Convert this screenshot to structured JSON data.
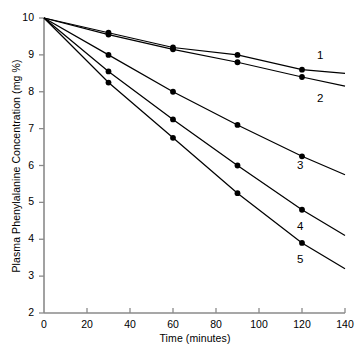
{
  "chart_data": {
    "type": "line",
    "title": "",
    "xlabel": "Time (minutes)",
    "ylabel": "Plasma Phenylalanine Concentration (mg %)",
    "xlim": [
      0,
      140
    ],
    "ylim": [
      2,
      10
    ],
    "xticks": [
      0,
      20,
      40,
      60,
      80,
      100,
      120,
      140
    ],
    "yticks": [
      2,
      3,
      4,
      5,
      6,
      7,
      8,
      9,
      10
    ],
    "xtick_labels": [
      "0",
      "20",
      "40",
      "60",
      "80",
      "100",
      "120",
      "140"
    ],
    "ytick_labels": [
      "2",
      "3",
      "4",
      "5",
      "6",
      "7",
      "8",
      "9",
      "10"
    ],
    "grid": false,
    "legend_position": "inline-right-end-of-line",
    "marker": "filled-circle",
    "line_color": "#000000",
    "marker_color": "#000000",
    "x": [
      0,
      30,
      60,
      90,
      120
    ],
    "series": [
      {
        "name": "1",
        "label": "1",
        "values": [
          10.0,
          9.6,
          9.2,
          9.0,
          8.6
        ],
        "line_end": {
          "x": 140,
          "y": 8.5
        }
      },
      {
        "name": "2",
        "label": "2",
        "values": [
          10.0,
          9.55,
          9.15,
          8.8,
          8.4
        ],
        "line_end": {
          "x": 140,
          "y": 8.15
        }
      },
      {
        "name": "3",
        "label": "3",
        "values": [
          10.0,
          9.0,
          8.0,
          7.1,
          6.25
        ],
        "line_end": {
          "x": 140,
          "y": 5.75
        }
      },
      {
        "name": "4",
        "label": "4",
        "values": [
          10.0,
          8.55,
          7.25,
          6.0,
          4.8
        ],
        "line_end": {
          "x": 140,
          "y": 4.1
        }
      },
      {
        "name": "5",
        "label": "5",
        "values": [
          10.0,
          8.25,
          6.75,
          5.25,
          3.9
        ],
        "line_end": {
          "x": 140,
          "y": 3.2
        }
      }
    ]
  },
  "axes": {
    "x_title": "Time (minutes)",
    "y_title": "Plasma Phenylalanine Concentration (mg %)"
  }
}
